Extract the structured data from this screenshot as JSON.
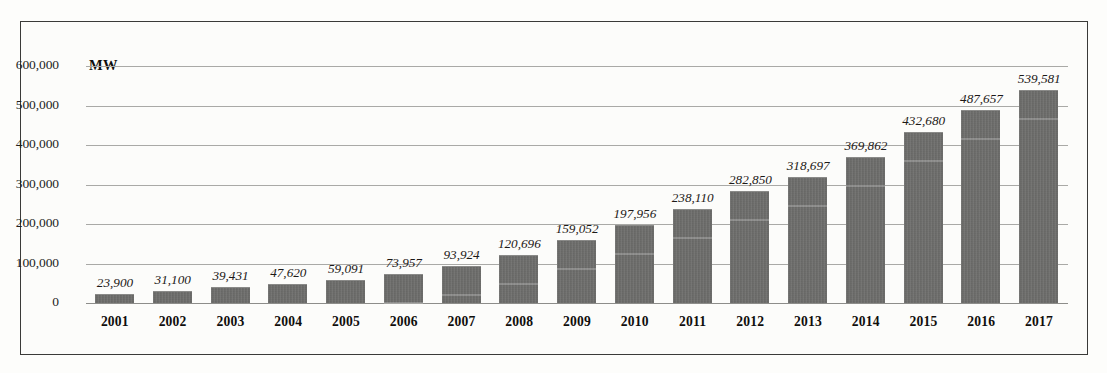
{
  "chart_data": {
    "type": "bar",
    "title": "",
    "subtitle": "",
    "xlabel": "",
    "ylabel": "MW",
    "unit_label": "MW",
    "categories": [
      "2001",
      "2002",
      "2003",
      "2004",
      "2005",
      "2006",
      "2007",
      "2008",
      "2009",
      "2010",
      "2011",
      "2012",
      "2013",
      "2014",
      "2015",
      "2016",
      "2017"
    ],
    "values": [
      23900,
      31100,
      39431,
      47620,
      59091,
      73957,
      93924,
      120696,
      159052,
      197956,
      238110,
      282850,
      318697,
      369862,
      432680,
      487657,
      539581
    ],
    "value_labels": [
      "23,900",
      "31,100",
      "39,431",
      "47,620",
      "59,091",
      "73,957",
      "93,924",
      "120,696",
      "159,052",
      "197,956",
      "238,110",
      "282,850",
      "318,697",
      "369,862",
      "432,680",
      "487,657",
      "539,581"
    ],
    "ylim": [
      0,
      600000
    ],
    "ytick_values": [
      0,
      100000,
      200000,
      300000,
      400000,
      500000,
      600000
    ],
    "ytick_labels": [
      "0",
      "100,000",
      "200,000",
      "300,000",
      "400,000",
      "500,000",
      "600,000"
    ],
    "grid": true,
    "legend": "none",
    "series": [
      {
        "name": "Cumulative installed capacity",
        "values": [
          23900,
          31100,
          39431,
          47620,
          59091,
          73957,
          93924,
          120696,
          159052,
          197956,
          238110,
          282850,
          318697,
          369862,
          432680,
          487657,
          539581
        ]
      }
    ],
    "colors": {
      "bar_fill": "#6d6d6b",
      "gridline": "#a9a9a6",
      "text": "#1c1917",
      "frame": "#3a3a38",
      "background": "#fcfcfa"
    }
  }
}
